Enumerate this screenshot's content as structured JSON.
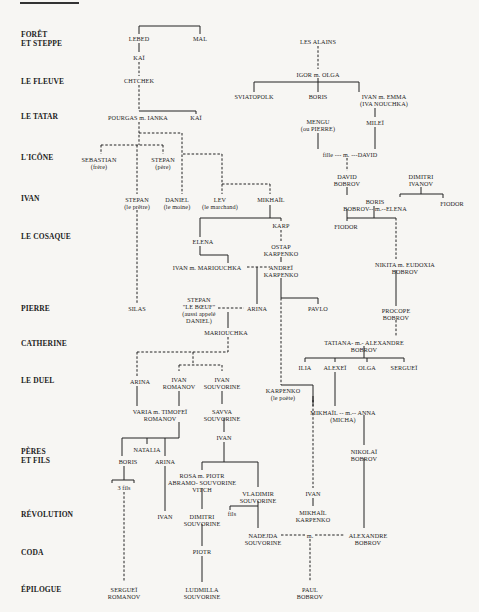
{
  "chapters": [
    {
      "label": "FORÊT\nET STEPPE",
      "y": 35
    },
    {
      "label": "LE FLEUVE",
      "y": 81
    },
    {
      "label": "LE TATAR",
      "y": 116
    },
    {
      "label": "L'ICÔNE",
      "y": 157
    },
    {
      "label": "IVAN",
      "y": 198
    },
    {
      "label": "LE COSAQUE",
      "y": 236
    },
    {
      "label": "PIERRE",
      "y": 308
    },
    {
      "label": "CATHERINE",
      "y": 343
    },
    {
      "label": "LE DUEL",
      "y": 380
    },
    {
      "label": "PÈRES\nET FILS",
      "y": 456
    },
    {
      "label": "RÉVOLUTION",
      "y": 514
    },
    {
      "label": "CODA",
      "y": 552
    },
    {
      "label": "ÉPILOGUE",
      "y": 589
    }
  ],
  "people": [
    {
      "label": "LEBED",
      "x": 139,
      "y": 38
    },
    {
      "label": "MAL",
      "x": 200,
      "y": 38
    },
    {
      "label": "KAÏ",
      "x": 139,
      "y": 57
    },
    {
      "label": "CHTCHEK",
      "x": 139,
      "y": 80
    },
    {
      "label": "POURGAS m. IANKA",
      "x": 138,
      "y": 117
    },
    {
      "label": "KAÏ",
      "x": 196,
      "y": 117
    },
    {
      "label": "SEBASTIAN\n(frère)",
      "x": 99,
      "y": 159
    },
    {
      "label": "STEPAN\n(père)",
      "x": 163,
      "y": 159
    },
    {
      "label": "STEPAN\n(le prêtre)",
      "x": 137,
      "y": 199
    },
    {
      "label": "DANIEL\n(le moine)",
      "x": 177,
      "y": 199
    },
    {
      "label": "LEV\n(le marchand)",
      "x": 220,
      "y": 199
    },
    {
      "label": "MIKHAÏL",
      "x": 271,
      "y": 199
    },
    {
      "label": "ELENA",
      "x": 203,
      "y": 241
    },
    {
      "label": "IVAN m. MARIOUCHKA",
      "x": 207,
      "y": 267
    },
    {
      "label": "KARP",
      "x": 281,
      "y": 225
    },
    {
      "label": "OSTAP\nKARPENKO",
      "x": 281,
      "y": 246
    },
    {
      "label": "ANDREÏ\nKARPENKO",
      "x": 281,
      "y": 267
    },
    {
      "label": "SILAS",
      "x": 137,
      "y": 308
    },
    {
      "label": "STEPAN\n\"LE BŒUF\"\n(aussi appelé\nDANIEL)",
      "x": 199,
      "y": 298
    },
    {
      "label": "ARINA",
      "x": 257,
      "y": 308
    },
    {
      "label": "PAVLO",
      "x": 318,
      "y": 308
    },
    {
      "label": "MARIOUCHKA",
      "x": 226,
      "y": 332
    },
    {
      "label": "ARINA",
      "x": 140,
      "y": 381
    },
    {
      "label": "IVAN\nROMANOV",
      "x": 179,
      "y": 378
    },
    {
      "label": "IVAN\nSOUVORINE",
      "x": 222,
      "y": 378
    },
    {
      "label": "VARIA m. TIMOFEÏ\nROMANOV",
      "x": 160,
      "y": 411
    },
    {
      "label": "SAVVA\nSOUVORINE",
      "x": 222,
      "y": 411
    },
    {
      "label": "IVAN",
      "x": 224,
      "y": 437
    },
    {
      "label": "NATALIA",
      "x": 147,
      "y": 449
    },
    {
      "label": "BORIS",
      "x": 128,
      "y": 461
    },
    {
      "label": "ARINA",
      "x": 165,
      "y": 461
    },
    {
      "label": "3 fils",
      "x": 124,
      "y": 487
    },
    {
      "label": "ROSA m. PIOTR\nABRAMO- SOUVORINE\nVITCH",
      "x": 202,
      "y": 476
    },
    {
      "label": "VLADIMIR\nSOUVORINE",
      "x": 258,
      "y": 494
    },
    {
      "label": "fils",
      "x": 232,
      "y": 513
    },
    {
      "label": "IVAN",
      "x": 165,
      "y": 516
    },
    {
      "label": "DIMITRI\nSOUVORINE",
      "x": 202,
      "y": 516
    },
    {
      "label": "NADEJDA\nSOUVORINE",
      "x": 263,
      "y": 535
    },
    {
      "label": "PIOTR",
      "x": 202,
      "y": 551
    },
    {
      "label": "SERGUEÏ\nROMANOV",
      "x": 124,
      "y": 589
    },
    {
      "label": "LUDMILLA\nSOUVORINE",
      "x": 202,
      "y": 589
    },
    {
      "label": "LES ALAINS",
      "x": 318,
      "y": 41
    },
    {
      "label": "IGOR m. OLGA",
      "x": 318,
      "y": 74
    },
    {
      "label": "SVIATOPOLK",
      "x": 254,
      "y": 96
    },
    {
      "label": "BORIS",
      "x": 318,
      "y": 96
    },
    {
      "label": "IVAN m. EMMA\n(IVA NOUCHKA)",
      "x": 384,
      "y": 96
    },
    {
      "label": "MENGU\n(ou PIERRE)",
      "x": 318,
      "y": 121
    },
    {
      "label": "MILEÏ",
      "x": 375,
      "y": 122
    },
    {
      "label": "fille --- m. ---DAVID",
      "x": 350,
      "y": 154
    },
    {
      "label": "DAVID\nBOBROV",
      "x": 347,
      "y": 176
    },
    {
      "label": "DIMITRI\nIVANOV",
      "x": 421,
      "y": 176
    },
    {
      "label": "BORIS\nBOBROV-- m.--ELENA",
      "x": 375,
      "y": 200
    },
    {
      "label": "FIODOR",
      "x": 452,
      "y": 203
    },
    {
      "label": "FIODOR",
      "x": 346,
      "y": 226
    },
    {
      "label": "NIKITA m. EUDOXIA\nBOBROV",
      "x": 405,
      "y": 264
    },
    {
      "label": "PROCOPE\nBOBROV",
      "x": 396,
      "y": 313
    },
    {
      "label": "TATIANA- m.- ALEXANDRE\nBOBROV",
      "x": 364,
      "y": 342
    },
    {
      "label": "ILIA",
      "x": 305,
      "y": 367
    },
    {
      "label": "ALEXEÏ",
      "x": 335,
      "y": 367
    },
    {
      "label": "OLGA",
      "x": 367,
      "y": 367
    },
    {
      "label": "SERGUEÏ",
      "x": 404,
      "y": 367
    },
    {
      "label": "KARPENKO\n(le poète)",
      "x": 283,
      "y": 390
    },
    {
      "label": "MIKHAÏL -- m.-- ANNA\n(MICHA)",
      "x": 343,
      "y": 412
    },
    {
      "label": "NIKOLAÏ\nBOBROV",
      "x": 364,
      "y": 451
    },
    {
      "label": "IVAN",
      "x": 313,
      "y": 493
    },
    {
      "label": "MIKHAÏL\nKARPENKO",
      "x": 313,
      "y": 512
    },
    {
      "label": "ALEXANDRE\nBOBROV",
      "x": 368,
      "y": 535
    },
    {
      "label": "PAUL\nBOBROV",
      "x": 310,
      "y": 589
    }
  ],
  "marriage_label": "m.",
  "colors": {
    "background": "#f7f6f3",
    "ink": "#1c1c1c"
  }
}
